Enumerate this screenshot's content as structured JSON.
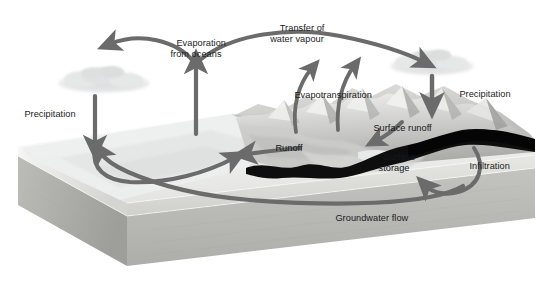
{
  "figure": {
    "type": "diagram",
    "width": 545,
    "height": 289,
    "background": "#ffffff"
  },
  "palette": {
    "arrow": "#6b6b6b",
    "arrow_dark": "#5a5a5a",
    "text": "#1c1c1c",
    "cloud": "#d9dadb",
    "block_top": "#f2f2f0",
    "block_front": "#dcdcda",
    "block_side": "#c9c9c6",
    "block_lower": "#b7b7b3",
    "rock_band": "#0d0d0d",
    "ocean": "#eceded",
    "mountain_light": "#e7e7e5",
    "mountain_mid": "#bdbdbb",
    "mountain_dark": "#8e8e8c"
  },
  "labels": [
    {
      "id": "evaporation-from-oceans",
      "text": "Evaporation\nfrom oceans",
      "x": 196,
      "y": 28,
      "align": "center"
    },
    {
      "id": "transfer-of-water-vapour",
      "text": "Transfer of\nwater vapour",
      "x": 297,
      "y": 13,
      "align": "center"
    },
    {
      "id": "precipitation-left",
      "text": "Precipitation",
      "x": 14,
      "y": 99,
      "align": "left"
    },
    {
      "id": "evapotranspiration",
      "text": "Evapotranspiration",
      "x": 284,
      "y": 80,
      "align": "left"
    },
    {
      "id": "precipitation-right",
      "text": "Precipitation",
      "x": 449,
      "y": 79,
      "align": "left"
    },
    {
      "id": "runoff",
      "text": "Runoff",
      "x": 265,
      "y": 133,
      "align": "left"
    },
    {
      "id": "surface-runoff",
      "text": "Surface runoff",
      "x": 363,
      "y": 113,
      "align": "left"
    },
    {
      "id": "surface-storage",
      "text": "Surface\nstorage",
      "x": 372,
      "y": 142,
      "align": "left"
    },
    {
      "id": "infiltration",
      "text": "Infiltration",
      "x": 459,
      "y": 151,
      "align": "left"
    },
    {
      "id": "groundwater-flow",
      "text": "Groundwater flow",
      "x": 325,
      "y": 203,
      "align": "left"
    }
  ],
  "flows": [
    {
      "id": "ocean-to-land-vapour",
      "from": "ocean",
      "to": "land",
      "label": "Transfer of water vapour"
    },
    {
      "id": "ocean-evaporation",
      "from": "ocean surface",
      "to": "atmosphere",
      "label": "Evaporation from oceans"
    },
    {
      "id": "cloud-precipitation-left",
      "from": "cloud",
      "to": "ocean",
      "label": "Precipitation"
    },
    {
      "id": "cloud-precipitation-right",
      "from": "cloud",
      "to": "mountains",
      "label": "Precipitation"
    },
    {
      "id": "land-evapotranspiration",
      "from": "land surface",
      "to": "atmosphere",
      "label": "Evapotranspiration"
    },
    {
      "id": "land-runoff",
      "from": "mountains",
      "to": "ocean",
      "label": "Runoff"
    },
    {
      "id": "slope-surface-runoff",
      "from": "uplands",
      "to": "surface storage",
      "label": "Surface runoff"
    },
    {
      "id": "soil-infiltration",
      "from": "surface",
      "to": "groundwater",
      "label": "Infiltration"
    },
    {
      "id": "subsurface-groundwater-flow",
      "from": "groundwater",
      "to": "ocean",
      "label": "Groundwater flow"
    }
  ]
}
